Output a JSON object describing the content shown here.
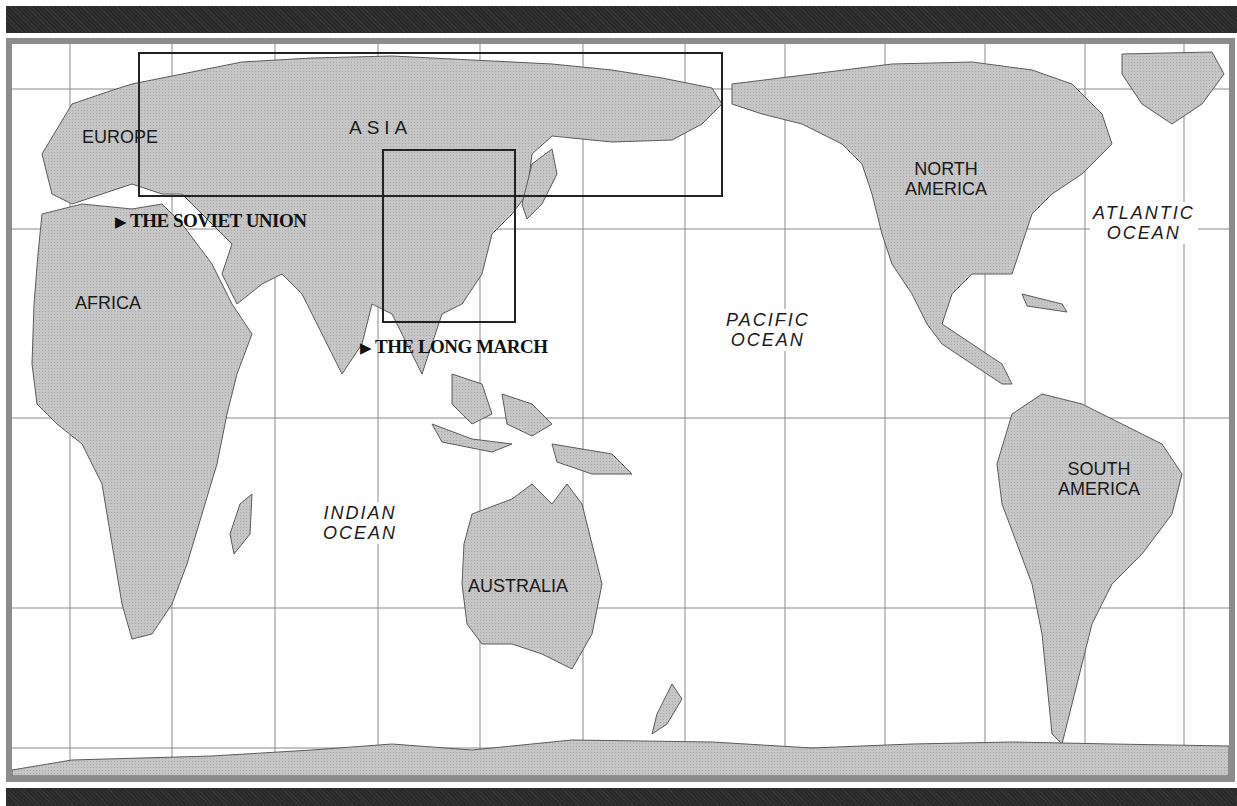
{
  "map": {
    "title": "World map",
    "colors": {
      "land": "#c4c4c4",
      "land_outline": "#555555",
      "ocean": "#ffffff",
      "gridline": "#888888",
      "frame": "#8c8c8c",
      "bars": "#2a2a2a",
      "region_box": "#222222"
    },
    "continents": [
      {
        "id": "europe",
        "label": "EUROPE"
      },
      {
        "id": "asia",
        "label": "ASIA"
      },
      {
        "id": "africa",
        "label": "AFRICA"
      },
      {
        "id": "north-america",
        "line1": "NORTH",
        "line2": "AMERICA"
      },
      {
        "id": "south-america",
        "line1": "SOUTH",
        "line2": "AMERICA"
      },
      {
        "id": "australia",
        "label": "AUSTRALIA"
      }
    ],
    "oceans": [
      {
        "id": "atlantic",
        "line1": "ATLANTIC",
        "line2": "OCEAN"
      },
      {
        "id": "pacific",
        "line1": "PACIFIC",
        "line2": "OCEAN"
      },
      {
        "id": "indian",
        "line1": "INDIAN",
        "line2": "OCEAN"
      }
    ],
    "region_links": [
      {
        "id": "soviet-union",
        "arrow": "▶",
        "label": "THE SOVIET UNION"
      },
      {
        "id": "long-march",
        "arrow": "▶",
        "label": "THE LONG MARCH"
      }
    ]
  }
}
